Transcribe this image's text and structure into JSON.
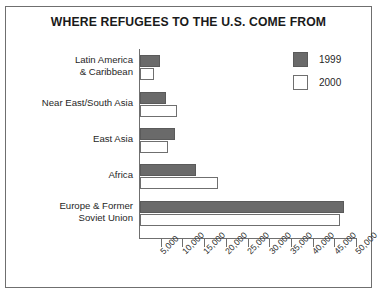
{
  "chart_data": {
    "type": "bar",
    "orientation": "horizontal",
    "title": "WHERE REFUGEES TO THE U.S. COME FROM",
    "xlabel": "",
    "ylabel": "",
    "categories": [
      "Latin America\n& Caribbean",
      "Near East/South Asia",
      "East Asia",
      "Africa",
      "Europe & Former\nSoviet Union"
    ],
    "series": [
      {
        "name": "1999",
        "color": "#6a6a6a",
        "values": [
          4500,
          6000,
          8000,
          13000,
          47000
        ]
      },
      {
        "name": "2000",
        "color": "#ffffff",
        "values": [
          3200,
          8500,
          6500,
          18000,
          46000
        ]
      }
    ],
    "xlim": [
      0,
      50000
    ],
    "xticks": [
      5000,
      10000,
      15000,
      20000,
      25000,
      30000,
      35000,
      40000,
      45000,
      50000
    ],
    "xticklabels": [
      "5,000",
      "10,000",
      "15,000",
      "20,000",
      "25,000",
      "30,000",
      "35,000",
      "40,000",
      "45,000",
      "50,000"
    ],
    "grid": false,
    "legend_position": "upper right"
  },
  "categories_display": [
    {
      "line1": "Latin America",
      "line2": "& Caribbean"
    },
    {
      "line1": "Near East/South Asia",
      "line2": ""
    },
    {
      "line1": "East Asia",
      "line2": ""
    },
    {
      "line1": "Africa",
      "line2": ""
    },
    {
      "line1": "Europe & Former",
      "line2": "Soviet Union"
    }
  ],
  "legend": {
    "items": [
      {
        "label": "1999"
      },
      {
        "label": "2000"
      }
    ]
  }
}
